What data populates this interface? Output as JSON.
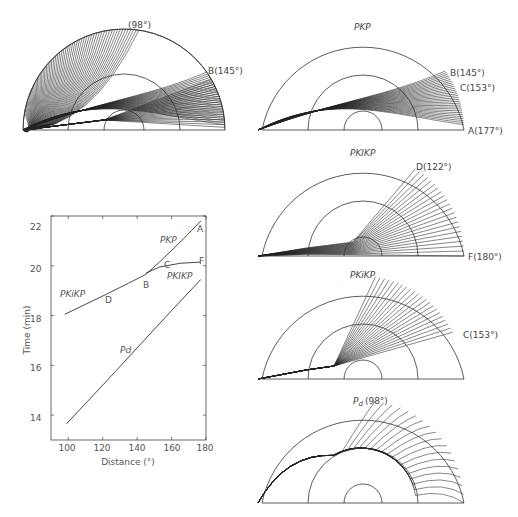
{
  "panels": {
    "all_rays": {
      "label_top": "(98°)",
      "label_b": "B(145°)"
    },
    "pkp": {
      "title": "PKP",
      "label_b": "B(145°)",
      "label_c": "C(153°)",
      "label_a": "A(177°)"
    },
    "pkikp": {
      "title": "PKIKP",
      "label_d": "D(122°)",
      "label_f": "F(180°)"
    },
    "pkikp_c": {
      "title": "PKiKP",
      "label_c": "C(153°)"
    },
    "pd": {
      "title_main": "P",
      "title_sub": "d",
      "title_angle": "(98°)"
    }
  },
  "chart_data": {
    "type": "line",
    "title": "",
    "xlabel": "Distance (°)",
    "ylabel": "Time (min)",
    "xlim": [
      90,
      180
    ],
    "ylim": [
      13,
      22
    ],
    "xticks": [
      100,
      120,
      140,
      160,
      180
    ],
    "yticks": [
      14,
      16,
      18,
      20,
      22
    ],
    "grid": false,
    "series": [
      {
        "name": "PKiKP",
        "x": [
          98,
          110,
          122,
          135,
          145
        ],
        "y": [
          18.05,
          18.45,
          18.85,
          19.3,
          19.65
        ]
      },
      {
        "name": "PKP",
        "x": [
          145,
          153,
          165,
          177
        ],
        "y": [
          19.65,
          20.15,
          20.95,
          21.8
        ]
      },
      {
        "name": "PKIKP",
        "x": [
          145,
          153,
          165,
          177
        ],
        "y": [
          19.7,
          19.95,
          20.1,
          20.15
        ]
      },
      {
        "name": "Pd",
        "x": [
          99,
          120,
          140,
          160,
          177
        ],
        "y": [
          13.65,
          15.2,
          16.7,
          18.2,
          19.45
        ]
      }
    ],
    "annotations": [
      {
        "text": "A",
        "x": 177,
        "y": 21.7
      },
      {
        "text": "B",
        "x": 146,
        "y": 19.3
      },
      {
        "text": "C",
        "x": 155,
        "y": 20.05
      },
      {
        "text": "D",
        "x": 122,
        "y": 18.6
      },
      {
        "text": "F",
        "x": 177,
        "y": 20.3
      },
      {
        "text": "PKP",
        "x": 151,
        "y": 20.85
      },
      {
        "text": "PKIKP",
        "x": 163,
        "y": 19.7
      },
      {
        "text": "PKiKP",
        "x": 103,
        "y": 18.9
      },
      {
        "text": "Pd",
        "x": 131,
        "y": 16.6
      }
    ]
  },
  "chart_text": {
    "ylabel": "Time (min)",
    "xlabel": "Distance (°)",
    "yticks": [
      "14",
      "16",
      "18",
      "20",
      "22"
    ],
    "xticks": [
      "100",
      "120",
      "140",
      "160",
      "180"
    ],
    "lab_A": "A",
    "lab_B": "B",
    "lab_C": "C",
    "lab_D": "D",
    "lab_F": "F",
    "lab_PKP": "PKP",
    "lab_PKIKP": "PKIKP",
    "lab_PKiKP": "PKiKP",
    "lab_Pd": "Pd"
  }
}
